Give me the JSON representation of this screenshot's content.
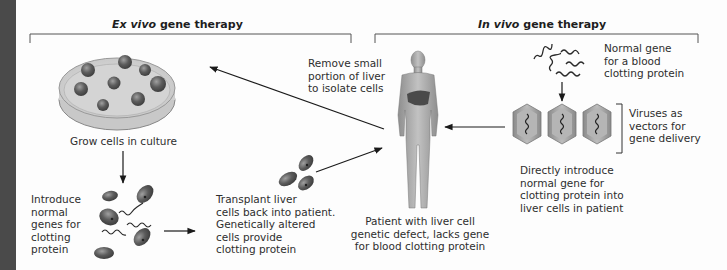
{
  "diagram": {
    "ex_vivo": {
      "title_italic": "Ex vivo",
      "title_rest": " gene therapy",
      "steps": {
        "grow": "Grow cells in culture",
        "introduce": "Introduce\nnormal\ngenes for\nclotting\nprotein",
        "transplant": "Transplant liver\ncells back into patient.\nGenetically altered\ncells provide\nclotting protein",
        "remove": "Remove small\nportion of liver\nto isolate cells"
      }
    },
    "in_vivo": {
      "title_italic": "In vivo",
      "title_rest": " gene therapy",
      "steps": {
        "normal_gene": "Normal gene\nfor a blood\nclotting protein",
        "viruses": "Viruses as\nvectors for\ngene delivery",
        "direct": "Directly introduce\nnormal gene for\nclotting protein into\nliver cells in patient"
      }
    },
    "patient": {
      "caption": "Patient with liver cell\ngenetic defect, lacks gene\nfor blood clotting protein"
    },
    "icons": [
      "petri-dish-icon",
      "liver-cell-icon",
      "dna-strand-icon",
      "human-figure-icon",
      "liver-organ-icon",
      "virus-vector-icon",
      "arrow-icon"
    ],
    "colors": {
      "cell": "#5a5a5a",
      "cell_highlight": "#9a9a9a",
      "dish_fill": "#d8d8d8",
      "virus": "#a8a8a8",
      "body": "#b0b0b0",
      "liver": "#4a4a4a",
      "line": "#1a1a1a",
      "side_strip": "#4a4a4a"
    }
  }
}
